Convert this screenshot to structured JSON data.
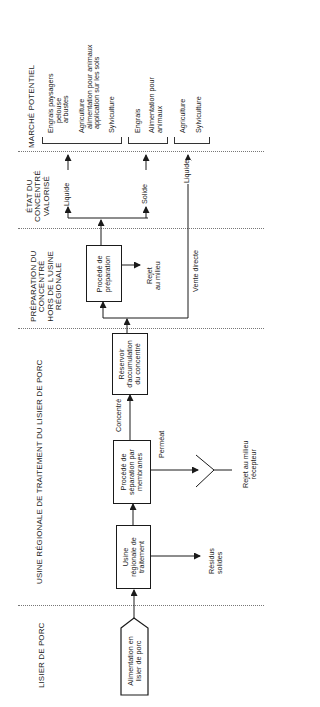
{
  "sections": {
    "marche": "MARCHÉ POTENTIEL",
    "etat": [
      "ÉTAT DU",
      "CONCENTRÉ",
      "VALORISÉ"
    ],
    "preparation": [
      "PRÉPARATION DU",
      "CONCENTRÉ",
      "HORS DE L'USINE",
      "RÉGIONALE"
    ],
    "usine": "USINE RÉGIONALE DE TRAITEMENT DU LISIER DE PORC",
    "lisier": "LISIER DE PORC"
  },
  "boxes": {
    "alimentation": [
      "Alimentation en",
      "lisier de porc"
    ],
    "usine": [
      "Usine",
      "régionale de",
      "traitement"
    ],
    "separation": [
      "Procédé de",
      "séparation par",
      "membranes"
    ],
    "reservoir": [
      "Réservoir",
      "d'accumulation",
      "du concentré"
    ],
    "preparation": [
      "Procédé de",
      "préparation"
    ]
  },
  "labels": {
    "residus": [
      "Résidus",
      "solides"
    ],
    "permeat": "Perméat",
    "rejet_recepteur": [
      "Rejet au milieu",
      "récepteur"
    ],
    "concentre": "Concentré",
    "rejet_milieu": [
      "Rejet",
      "au milieu"
    ],
    "vente_directe": "Vente directe",
    "liquide_1": "Liquide",
    "solide": "Solide",
    "liquide_2": "Liquide"
  },
  "markets": {
    "group1": {
      "engrais_paysagers": [
        "Engrais paysagers",
        "pelouse",
        "arbustes"
      ],
      "agriculture": [
        "Agriculture",
        "alimentation pour animaux",
        "application sur les sols"
      ],
      "sylviculture": "Sylviculture"
    },
    "group2": {
      "engrais": "Engrais",
      "alimentation": [
        "Alimentation pour",
        "animaux"
      ]
    },
    "group3": {
      "agriculture": "Agriculture",
      "sylviculture": "Sylviculture"
    }
  }
}
